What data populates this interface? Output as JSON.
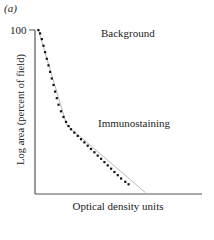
{
  "figure": {
    "panel_label": "(a)",
    "y_tick_label": "100",
    "annotation_background": "Background",
    "annotation_immunostaining": "Immunostaining",
    "xlabel": "Optical density units",
    "ylabel": "Log area (percent of field)"
  },
  "colors": {
    "axis": "#555555",
    "dots": "#111111",
    "guide_line": "#bbbbbb"
  },
  "chart_data": {
    "type": "scatter",
    "title": "",
    "panel": "(a)",
    "xlabel": "Optical density units",
    "ylabel": "Log area (percent of field)",
    "y_ticks": [
      "100"
    ],
    "x_ticks": [],
    "grid": false,
    "legend": "none",
    "annotations": [
      {
        "text": "Background",
        "position": "upper right"
      },
      {
        "text": "Immunostaining",
        "position": "middle right, beside curve inflection"
      }
    ],
    "series": [
      {
        "name": "Log area vs optical density",
        "x": [
          0.02,
          0.03,
          0.04,
          0.05,
          0.06,
          0.07,
          0.08,
          0.09,
          0.1,
          0.11,
          0.12,
          0.13,
          0.14,
          0.155,
          0.17,
          0.185,
          0.2,
          0.215,
          0.235,
          0.255,
          0.275,
          0.295,
          0.315,
          0.335,
          0.355,
          0.375,
          0.395,
          0.415,
          0.435,
          0.455,
          0.475,
          0.495,
          0.515,
          0.54,
          0.56
        ],
        "y": [
          1.0,
          0.98,
          0.945,
          0.905,
          0.865,
          0.825,
          0.785,
          0.745,
          0.705,
          0.665,
          0.625,
          0.585,
          0.545,
          0.505,
          0.47,
          0.44,
          0.415,
          0.395,
          0.375,
          0.355,
          0.335,
          0.315,
          0.295,
          0.275,
          0.255,
          0.235,
          0.215,
          0.195,
          0.175,
          0.155,
          0.135,
          0.115,
          0.095,
          0.075,
          0.06
        ]
      }
    ],
    "guide_line": {
      "x": [
        0.02,
        0.19,
        0.66
      ],
      "y": [
        1.0,
        0.42,
        0.01
      ]
    },
    "xlim": [
      0,
      1
    ],
    "ylim": [
      0,
      1
    ]
  }
}
